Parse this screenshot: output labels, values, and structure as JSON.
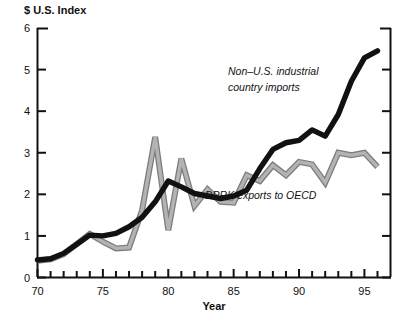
{
  "chart_data": {
    "type": "line",
    "title": "",
    "xlabel": "Year",
    "ylabel": "$ U.S. Index",
    "xlim": [
      70,
      96
    ],
    "ylim": [
      0,
      6
    ],
    "grid": false,
    "legend_position": "inline-annotations",
    "y_ticks": [
      0,
      1,
      2,
      3,
      4,
      5,
      6
    ],
    "y_tick_labels": [
      "0",
      "1",
      "2",
      "3",
      "4",
      "5",
      "6"
    ],
    "x_ticks": [
      70,
      71,
      72,
      73,
      74,
      75,
      76,
      77,
      78,
      79,
      80,
      81,
      82,
      83,
      84,
      85,
      86,
      87,
      88,
      89,
      90,
      91,
      92,
      93,
      94,
      95,
      96
    ],
    "x_major_ticks": [
      70,
      75,
      80,
      85,
      90,
      95
    ],
    "x_major_tick_labels": [
      "70",
      "75",
      "80",
      "85",
      "90",
      "95"
    ],
    "x": [
      70,
      71,
      72,
      73,
      74,
      75,
      76,
      77,
      78,
      79,
      80,
      81,
      82,
      83,
      84,
      85,
      86,
      87,
      88,
      89,
      90,
      91,
      92,
      93,
      94,
      95,
      96
    ],
    "series": [
      {
        "name": "Non–U.S. industrial country imports",
        "color": "#111111",
        "style": "thick-black",
        "values": [
          0.42,
          0.45,
          0.58,
          0.8,
          1.02,
          1.0,
          1.06,
          1.22,
          1.45,
          1.82,
          2.32,
          2.18,
          2.02,
          1.96,
          1.9,
          1.96,
          2.1,
          2.62,
          3.08,
          3.24,
          3.3,
          3.55,
          3.4,
          3.92,
          4.72,
          5.28,
          5.45
        ]
      },
      {
        "name": "DPRK exports to OECD",
        "color": "#b3b3b3",
        "style": "thick-gray-outlined",
        "values": [
          0.4,
          0.44,
          0.56,
          0.8,
          1.05,
          0.86,
          0.7,
          0.72,
          1.62,
          3.38,
          1.14,
          2.86,
          1.72,
          2.12,
          1.82,
          1.8,
          2.46,
          2.32,
          2.7,
          2.46,
          2.78,
          2.72,
          2.28,
          3.0,
          2.94,
          3.0,
          2.66
        ]
      }
    ],
    "annotations": [
      {
        "text_line1": "Non–U.S. industrial",
        "text_line2": "country imports",
        "x": 96.5,
        "y": 4.6
      },
      {
        "text_line1": "DPRK exports to OECD",
        "text_line2": "",
        "x": 96.5,
        "y": 2.0
      }
    ]
  },
  "labels": {
    "y_axis_title": "$ U.S. Index",
    "x_axis_title": "Year",
    "series_black_line1": "Non–U.S. industrial",
    "series_black_line2": "country imports",
    "series_gray_line1": "DPRK exports to OECD"
  },
  "colors": {
    "background": "#ffffff",
    "axis": "#111111",
    "series_black": "#111111",
    "series_gray": "#b3b3b3",
    "series_gray_outline": "#7d7d7d"
  }
}
